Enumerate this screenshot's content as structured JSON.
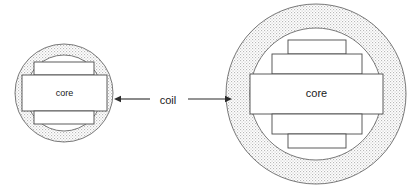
{
  "diagram": {
    "background_color": "#ffffff",
    "stipple_color": "#bdbdbd",
    "outline_color": "#555555",
    "rect_outline_color": "#4a4a4a",
    "rect_fill_color": "#ffffff",
    "text_color": "#1a1a1a",
    "annotation": {
      "label": "coil",
      "label_x": 168,
      "label_y": 101,
      "font_size": 11,
      "arrow_left": {
        "name": "arrow-left",
        "from_x": 150,
        "to_x": 114,
        "y": 99
      },
      "arrow_right": {
        "name": "arrow-right",
        "from_x": 188,
        "to_x": 232,
        "y": 99
      }
    },
    "figures": [
      {
        "id": "small-coil",
        "name": "small-coil-figure",
        "core_label": "core",
        "center_x": 64,
        "center_y": 93,
        "outer_radius": 49,
        "inner_radius": 38,
        "label_font_size": 9,
        "bands": [
          {
            "name": "band-top",
            "x": 34,
            "y": 62,
            "width": 60,
            "height": 13
          },
          {
            "name": "band-center",
            "x": 22,
            "y": 75,
            "width": 85,
            "height": 36,
            "label": "core"
          },
          {
            "name": "band-bottom",
            "x": 34,
            "y": 111,
            "width": 60,
            "height": 13
          }
        ]
      },
      {
        "id": "large-coil",
        "name": "large-coil-figure",
        "core_label": "core",
        "center_x": 316,
        "center_y": 94,
        "outer_radius": 90,
        "inner_radius": 66,
        "label_font_size": 11,
        "bands": [
          {
            "name": "band-top",
            "x": 288,
            "y": 40,
            "width": 58,
            "height": 14
          },
          {
            "name": "band-upper-mid",
            "x": 272,
            "y": 54,
            "width": 90,
            "height": 20
          },
          {
            "name": "band-center",
            "x": 250,
            "y": 74,
            "width": 133,
            "height": 40,
            "label": "core"
          },
          {
            "name": "band-lower-mid",
            "x": 272,
            "y": 114,
            "width": 90,
            "height": 20
          },
          {
            "name": "band-bottom",
            "x": 288,
            "y": 134,
            "width": 58,
            "height": 14
          }
        ]
      }
    ]
  }
}
